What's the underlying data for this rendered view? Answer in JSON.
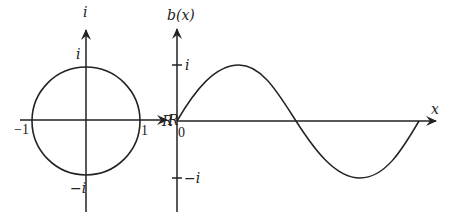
{
  "colors": {
    "stroke": "#222222",
    "background": "#ffffff"
  },
  "left_plot": {
    "title": "complex unit circle",
    "vertical_axis_label": "i",
    "horizontal_axis_label": "R",
    "top_intercept_label": "i",
    "bottom_intercept_label": "−i",
    "left_intercept_label": "−1",
    "right_intercept_label": "1"
  },
  "right_plot": {
    "title": "b(x) sine-like wave",
    "vertical_axis_label": "b(x)",
    "horizontal_axis_label": "x",
    "origin_left_label": "R",
    "origin_label": "0",
    "upper_tick_label": "i",
    "lower_tick_label": "−i"
  }
}
